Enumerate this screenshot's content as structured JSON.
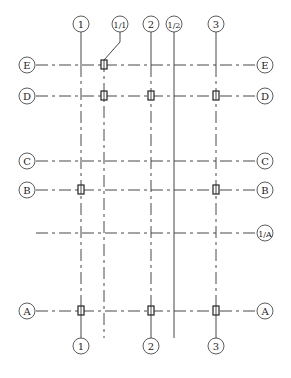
{
  "drawing": {
    "type": "structural-grid-plan",
    "columns_top": [
      {
        "label": "1",
        "x": 81
      },
      {
        "label": "1/1",
        "x": 120,
        "leader_to_x": 104
      },
      {
        "label": "2",
        "x": 151
      },
      {
        "label": "1/2",
        "x": 174
      },
      {
        "label": "3",
        "x": 216
      }
    ],
    "columns_bottom": [
      {
        "label": "1",
        "x": 81
      },
      {
        "label": "2",
        "x": 151
      },
      {
        "label": "3",
        "x": 216
      }
    ],
    "rows": [
      {
        "label": "E",
        "y": 65,
        "left": true,
        "right": true
      },
      {
        "label": "D",
        "y": 96,
        "left": true,
        "right": true
      },
      {
        "label": "C",
        "y": 161,
        "left": true,
        "right": true
      },
      {
        "label": "B",
        "y": 190,
        "left": true,
        "right": true
      },
      {
        "label": "1/A",
        "y": 233,
        "left": false,
        "right": true
      },
      {
        "label": "A",
        "y": 311,
        "left": true,
        "right": true
      }
    ],
    "column_boxes": [
      {
        "at": "1/1-E"
      },
      {
        "at": "1/1-D"
      },
      {
        "at": "2-D"
      },
      {
        "at": "3-D"
      },
      {
        "at": "1-B"
      },
      {
        "at": "3-B"
      },
      {
        "at": "1-A"
      },
      {
        "at": "2-A"
      },
      {
        "at": "3-A"
      }
    ],
    "colors": {
      "line": "#333333",
      "background": "#ffffff"
    }
  },
  "labels": {
    "top_1": "1",
    "top_11": "1/1",
    "top_2": "2",
    "top_12": "1/2",
    "top_3": "3",
    "bot_1": "1",
    "bot_2": "2",
    "bot_3": "3",
    "row_E": "E",
    "row_D": "D",
    "row_C": "C",
    "row_B": "B",
    "row_1A": "1/A",
    "row_A": "A"
  }
}
